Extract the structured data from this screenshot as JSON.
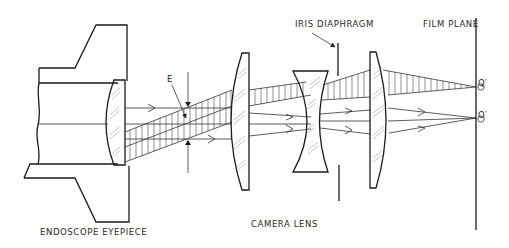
{
  "diagram": {
    "labels": {
      "eyepiece": "ENDOSCOPE  EYEPIECE",
      "camera_lens": "CAMERA   LENS",
      "iris": "IRIS  DIAPHRAGM",
      "film_plane": "FILM  PLANE",
      "exit_pupil": "E",
      "image_point_q": "Q′",
      "image_point_o": "O′"
    },
    "colors": {
      "background": "#ffffff",
      "line": "#1a1a1a"
    }
  }
}
